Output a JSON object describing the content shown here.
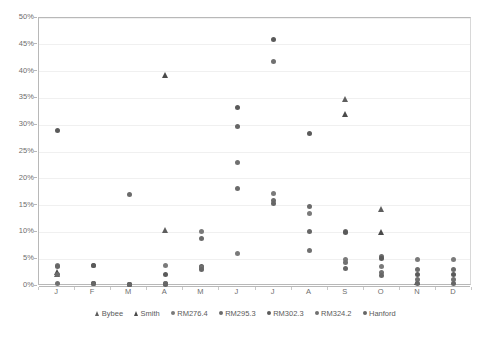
{
  "chart_data": {
    "type": "scatter",
    "title": "",
    "subtitle": "",
    "xlabel": "",
    "ylabel": "",
    "ylim": [
      0,
      0.5
    ],
    "y_ticks": [
      0,
      0.05,
      0.1,
      0.15,
      0.2,
      0.25,
      0.3,
      0.35,
      0.4,
      0.45,
      0.5
    ],
    "y_tick_labels": [
      "0%",
      "5%",
      "10%",
      "15%",
      "20%",
      "25%",
      "30%",
      "35%",
      "40%",
      "45%",
      "50%"
    ],
    "grid": true,
    "legend_position": "bottom",
    "categories": [
      "J",
      "F",
      "M",
      "A",
      "M",
      "J",
      "J",
      "A",
      "S",
      "O",
      "N",
      "D"
    ],
    "x_tick_labels": [
      "J",
      "F",
      "M",
      "A",
      "M",
      "J",
      "J",
      "A",
      "S",
      "O",
      "N",
      "D"
    ],
    "series": [
      {
        "name": "Bybee",
        "marker": "triangle",
        "color": "#5e5e5e",
        "points": [
          {
            "x": "J",
            "y": 0.022
          },
          {
            "x": "A",
            "y": 0.104
          },
          {
            "x": "S",
            "y": 0.349
          },
          {
            "x": "O",
            "y": 0.143
          }
        ]
      },
      {
        "name": "Smith",
        "marker": "triangle",
        "color": "#4a4a4a",
        "points": [
          {
            "x": "J",
            "y": 0.027
          },
          {
            "x": "A",
            "y": 0.393
          },
          {
            "x": "S",
            "y": 0.321
          },
          {
            "x": "O",
            "y": 0.1
          },
          {
            "x": "N",
            "y": 0.008
          }
        ]
      },
      {
        "name": "RM276.4",
        "marker": "circle",
        "color": "#7a7a7a",
        "points": [
          {
            "x": "J",
            "y": 0.038
          },
          {
            "x": "F",
            "y": 0.038
          },
          {
            "x": "M",
            "y": 0.003
          },
          {
            "x": "A",
            "y": 0.039
          },
          {
            "x": "M",
            "y": 0.101
          },
          {
            "x": "J",
            "y": 0.061
          },
          {
            "x": "J",
            "y": 0.173
          },
          {
            "x": "A",
            "y": 0.136
          },
          {
            "x": "S",
            "y": 0.05
          },
          {
            "x": "O",
            "y": 0.036
          },
          {
            "x": "N",
            "y": 0.05
          },
          {
            "x": "D",
            "y": 0.049
          }
        ]
      },
      {
        "name": "RM295.3",
        "marker": "circle",
        "color": "#6b6b6b",
        "points": [
          {
            "x": "J",
            "y": 0.021
          },
          {
            "x": "F",
            "y": 0.005
          },
          {
            "x": "M",
            "y": 0.17
          },
          {
            "x": "A",
            "y": 0.005
          },
          {
            "x": "M",
            "y": 0.089
          },
          {
            "x": "J",
            "y": 0.181
          },
          {
            "x": "J",
            "y": 0.159
          },
          {
            "x": "A",
            "y": 0.149
          },
          {
            "x": "S",
            "y": 0.102
          },
          {
            "x": "O",
            "y": 0.055
          },
          {
            "x": "N",
            "y": 0.031
          },
          {
            "x": "D",
            "y": 0.031
          }
        ]
      },
      {
        "name": "RM302.3",
        "marker": "circle",
        "color": "#5a5a5a",
        "points": [
          {
            "x": "J",
            "y": 0.29
          },
          {
            "x": "F",
            "y": 0.038
          },
          {
            "x": "M",
            "y": 0.003
          },
          {
            "x": "A",
            "y": 0.022
          },
          {
            "x": "M",
            "y": 0.037
          },
          {
            "x": "J",
            "y": 0.333
          },
          {
            "x": "J",
            "y": 0.459
          },
          {
            "x": "A",
            "y": 0.285
          },
          {
            "x": "S",
            "y": 0.099
          },
          {
            "x": "O",
            "y": 0.052
          },
          {
            "x": "N",
            "y": 0.022
          },
          {
            "x": "D",
            "y": 0.021
          }
        ]
      },
      {
        "name": "RM324.2",
        "marker": "circle",
        "color": "#707070",
        "points": [
          {
            "x": "J",
            "y": 0.005
          },
          {
            "x": "F",
            "y": 0.005
          },
          {
            "x": "M",
            "y": 0.003
          },
          {
            "x": "A",
            "y": 0.004
          },
          {
            "x": "M",
            "y": 0.034
          },
          {
            "x": "J",
            "y": 0.231
          },
          {
            "x": "J",
            "y": 0.418
          },
          {
            "x": "A",
            "y": 0.066
          },
          {
            "x": "S",
            "y": 0.043
          },
          {
            "x": "O",
            "y": 0.026
          },
          {
            "x": "N",
            "y": 0.012
          },
          {
            "x": "D",
            "y": 0.012
          }
        ]
      },
      {
        "name": "Hanford",
        "marker": "circle",
        "color": "#666666",
        "points": [
          {
            "x": "J",
            "y": 0.036
          },
          {
            "x": "F",
            "y": 0.004
          },
          {
            "x": "M",
            "y": 0.003
          },
          {
            "x": "A",
            "y": 0.003
          },
          {
            "x": "M",
            "y": 0.031
          },
          {
            "x": "J",
            "y": 0.297
          },
          {
            "x": "J",
            "y": 0.153
          },
          {
            "x": "A",
            "y": 0.101
          },
          {
            "x": "S",
            "y": 0.033
          },
          {
            "x": "O",
            "y": 0.019
          },
          {
            "x": "N",
            "y": 0.004
          },
          {
            "x": "D",
            "y": 0.005
          }
        ]
      }
    ],
    "legend_entries": [
      {
        "label": "Bybee",
        "marker": "triangle",
        "color": "#5e5e5e"
      },
      {
        "label": "Smith",
        "marker": "triangle",
        "color": "#4a4a4a"
      },
      {
        "label": "RM276.4",
        "marker": "circle",
        "color": "#7a7a7a"
      },
      {
        "label": "RM295.3",
        "marker": "circle",
        "color": "#6b6b6b"
      },
      {
        "label": "RM302.3",
        "marker": "circle",
        "color": "#5a5a5a"
      },
      {
        "label": "RM324.2",
        "marker": "circle",
        "color": "#707070"
      },
      {
        "label": "Hanford",
        "marker": "circle",
        "color": "#666666"
      }
    ]
  }
}
